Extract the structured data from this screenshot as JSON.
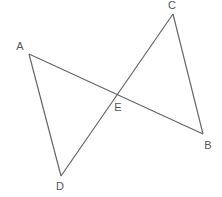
{
  "diagram": {
    "type": "geometry",
    "line_color": "#666666",
    "label_color": "#555555",
    "points": {
      "A": {
        "label": "A",
        "x": 29,
        "y": 54,
        "lx": 20,
        "ly": 50
      },
      "B": {
        "label": "B",
        "x": 203,
        "y": 134,
        "lx": 208,
        "ly": 149
      },
      "C": {
        "label": "C",
        "x": 173,
        "y": 14,
        "lx": 172,
        "ly": 9
      },
      "D": {
        "label": "D",
        "x": 61,
        "y": 176,
        "lx": 60,
        "ly": 190
      },
      "E": {
        "label": "E",
        "x": 117,
        "y": 91,
        "lx": 118,
        "ly": 111
      }
    },
    "segments": [
      {
        "from": "A",
        "to": "B"
      },
      {
        "from": "C",
        "to": "D"
      },
      {
        "from": "A",
        "to": "D"
      },
      {
        "from": "C",
        "to": "B"
      }
    ]
  }
}
